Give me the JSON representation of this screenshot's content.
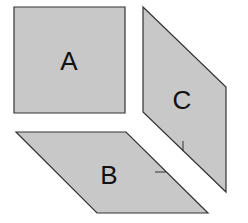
{
  "diagram": {
    "faces": [
      {
        "id": "A",
        "label": "A",
        "shape": "square"
      },
      {
        "id": "B",
        "label": "B",
        "shape": "parallelogram"
      },
      {
        "id": "C",
        "label": "C",
        "shape": "parallelogram"
      }
    ],
    "colors": {
      "fill": "#c8c8c8",
      "stroke": "#333333",
      "text": "#111111"
    }
  }
}
